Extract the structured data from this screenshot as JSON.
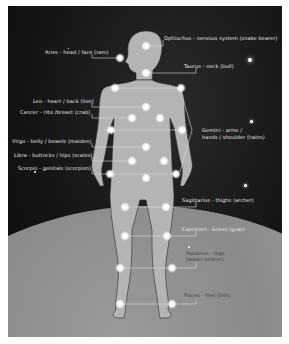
{
  "diagram": {
    "labels": [
      {
        "id": "ophiuchus",
        "text": "Ophiuchus - nervous system (snake bearer)"
      },
      {
        "id": "aries",
        "text": "Aries - head / face (ram)"
      },
      {
        "id": "taurus",
        "text": "Taurus - neck (bull)"
      },
      {
        "id": "leo",
        "text": "Leo - heart / back (lion)"
      },
      {
        "id": "cancer",
        "text": "Cancer - ribs /breast (crab)"
      },
      {
        "id": "gemini_1",
        "text": "Gemini - arms /"
      },
      {
        "id": "gemini_2",
        "text": "hands / shoulder (twins)"
      },
      {
        "id": "virgo",
        "text": "Virgo - belly / bowels (maiden)"
      },
      {
        "id": "libra",
        "text": "Libra - buttocks / hips (scales)"
      },
      {
        "id": "scorpio",
        "text": "Scorpio - genitals (scorpion)"
      },
      {
        "id": "sagittarius",
        "text": "Sagittarius - thighs (archer)"
      },
      {
        "id": "capricorn",
        "text": "Capricorn - knees (goat)"
      },
      {
        "id": "aquarius_1",
        "text": "Aquarius - legs"
      },
      {
        "id": "aquarius_2",
        "text": "(water bearer)"
      },
      {
        "id": "pisces",
        "text": "Pisces - feet (fish)"
      }
    ],
    "colors": {
      "space": "#141414",
      "planet": "#9a9a9a",
      "figure": "#b4b4b4",
      "line": "#d8d8d8",
      "glow": "#ffffff"
    }
  }
}
